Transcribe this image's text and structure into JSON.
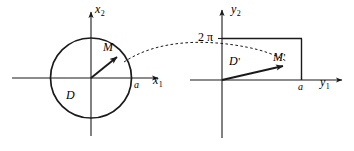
{
  "figure": {
    "stroke_color": "#1a1a1a",
    "background_color": "#ffffff"
  },
  "left_panel": {
    "name": "x-plane",
    "axis_horizontal_label": "x",
    "axis_horizontal_sub": "1",
    "axis_vertical_label": "x",
    "axis_vertical_sub": "2",
    "region_label": "D",
    "point_label": "M",
    "radius_tick_label": "a",
    "shape": "circle"
  },
  "right_panel": {
    "name": "y-plane",
    "axis_horizontal_label": "y",
    "axis_horizontal_sub": "1",
    "axis_vertical_label": "y",
    "axis_vertical_sub": "2",
    "region_label": "D",
    "region_label_prime": "'",
    "point_label": "M",
    "point_label_prime": "'",
    "top_tick_label": "2 π",
    "right_tick_label": "a",
    "shape": "rectangle"
  },
  "connector": {
    "style": "dashed-arc",
    "from": "M",
    "to": "M-prime"
  }
}
